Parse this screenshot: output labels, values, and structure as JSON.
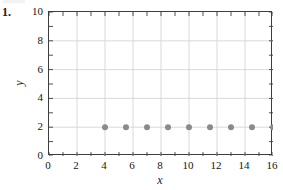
{
  "problem": {
    "number": "1."
  },
  "chart_data": {
    "type": "scatter",
    "title": "",
    "xlabel": "x",
    "ylabel": "y",
    "xlim": [
      0,
      16
    ],
    "ylim": [
      0,
      10
    ],
    "x_tick_labels": [
      "0",
      "2",
      "4",
      "6",
      "8",
      "10",
      "12",
      "14",
      "16"
    ],
    "x_tick_values": [
      0,
      2,
      4,
      6,
      8,
      10,
      12,
      14,
      16
    ],
    "x_minor_step": 1,
    "y_tick_labels": [
      "0",
      "2",
      "4",
      "6",
      "8",
      "10"
    ],
    "y_tick_values": [
      0,
      2,
      4,
      6,
      8,
      10
    ],
    "y_minor_step": 1,
    "grid": true,
    "grid_color": "#cfcfcf",
    "frame_color": "#3d3d3d",
    "legend": null,
    "marker_color": "#8a8a8a",
    "marker_radius": 3,
    "x": [
      4,
      5.5,
      7,
      8.5,
      10,
      11.5,
      13,
      14.5,
      16
    ],
    "y": [
      2,
      2,
      2,
      2,
      2,
      2,
      2,
      2,
      2
    ],
    "series": [
      {
        "name": "points",
        "points": [
          {
            "x": 4,
            "y": 2
          },
          {
            "x": 5.5,
            "y": 2
          },
          {
            "x": 7,
            "y": 2
          },
          {
            "x": 8.5,
            "y": 2
          },
          {
            "x": 10,
            "y": 2
          },
          {
            "x": 11.5,
            "y": 2
          },
          {
            "x": 13,
            "y": 2
          },
          {
            "x": 14.5,
            "y": 2
          },
          {
            "x": 16,
            "y": 2
          }
        ]
      }
    ]
  }
}
